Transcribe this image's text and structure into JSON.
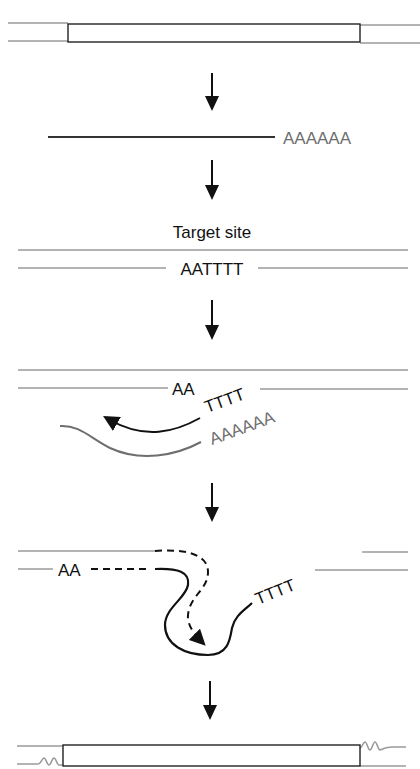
{
  "diagram": {
    "type": "retrotransposition-mechanism",
    "colors": {
      "dna_strand": "#9a9a9a",
      "ink": "#111111",
      "rna_strand": "#6e6e6e"
    },
    "panels": [
      {
        "id": "element-in-dna",
        "description": "Retrotransposon (box) inserted in double-stranded DNA"
      },
      {
        "id": "transcript",
        "polyA_label": "AAAAAA"
      },
      {
        "id": "target",
        "title": "Target site",
        "site_label": "AATTTT"
      },
      {
        "id": "nick-and-prime",
        "aa_label": "AA",
        "tttt_label": "TTTT",
        "polyA_label": "AAAAAA"
      },
      {
        "id": "second-strand",
        "aa_label": "AA",
        "tttt_label": "TTTT"
      },
      {
        "id": "inserted-element",
        "description": "Element integrated with target-site duplications"
      }
    ],
    "arrows": [
      {
        "id": "step-1",
        "icon": "down-arrow"
      },
      {
        "id": "step-2",
        "icon": "down-arrow"
      },
      {
        "id": "step-3",
        "icon": "down-arrow"
      },
      {
        "id": "step-4",
        "icon": "down-arrow"
      },
      {
        "id": "step-5",
        "icon": "down-arrow"
      }
    ]
  }
}
